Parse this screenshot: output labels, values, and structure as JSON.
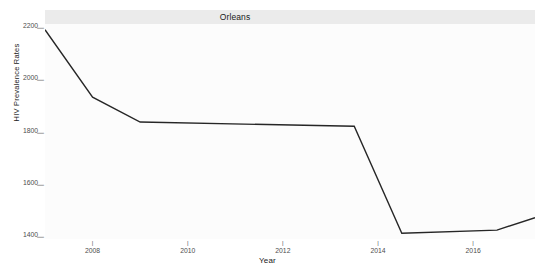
{
  "facet": {
    "strip_label": "Orleans"
  },
  "axes": {
    "x_title": "Year",
    "y_title": "HIV Prevalence Rates",
    "tickmark_glyph": "|",
    "y_ticks": [
      {
        "label": "2200",
        "value": 2200
      },
      {
        "label": "2000",
        "value": 2000
      },
      {
        "label": "1800",
        "value": 1800
      },
      {
        "label": "1600",
        "value": 1600
      },
      {
        "label": "1400",
        "value": 1400
      }
    ],
    "x_ticks": [
      {
        "label": "2008",
        "value": 2008
      },
      {
        "label": "2010",
        "value": 2010
      },
      {
        "label": "2012",
        "value": 2012
      },
      {
        "label": "2014",
        "value": 2014
      },
      {
        "label": "2016",
        "value": 2016
      }
    ]
  },
  "style": {
    "panel_background": "#fcfcfc",
    "strip_background": "#ebebeb",
    "line_color": "#262626",
    "tick_text_color": "#4d4d4d",
    "title_text_color": "#1a1a1a"
  },
  "chart_data": {
    "type": "line",
    "title": "Orleans",
    "xlabel": "Year",
    "ylabel": "HIV Prevalence Rates",
    "xlim": [
      2007.0,
      2017.3
    ],
    "ylim": [
      1390,
      2210
    ],
    "grid": false,
    "legend": null,
    "x": [
      2007.0,
      2008.0,
      2009.0,
      2013.5,
      2014.5,
      2016.5,
      2017.3
    ],
    "series": [
      {
        "name": "HIV Prevalence Rates",
        "color": "#262626",
        "values": [
          2188,
          1931,
          1836,
          1820,
          1412,
          1424,
          1471
        ]
      }
    ]
  }
}
